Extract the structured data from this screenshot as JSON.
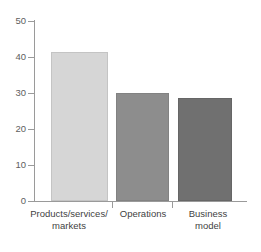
{
  "chart_data": {
    "type": "bar",
    "title": "",
    "subtitle": "",
    "xlabel": "",
    "ylabel": "",
    "categories": [
      "Products/services/ markets",
      "Operations",
      "Business model"
    ],
    "category_lines": [
      [
        "Products/services/",
        "markets"
      ],
      [
        "Operations",
        ""
      ],
      [
        "Business",
        "model"
      ]
    ],
    "values": [
      41.4,
      30.0,
      28.6
    ],
    "ylim": [
      0,
      50
    ],
    "yticks": [
      0,
      10,
      20,
      30,
      40,
      50
    ],
    "ytick_labels": [
      "0",
      "10",
      "20",
      "30",
      "40",
      "50"
    ],
    "grid": false,
    "legend": false,
    "bar_colors": [
      "#d6d6d6",
      "#8d8d8d",
      "#707070"
    ],
    "bar_edge_colors": [
      "#c4c4c4",
      "#828282",
      "#666666"
    ],
    "axis_color": "#9a9a9a",
    "tick_label_color": "#5e5e5e",
    "category_label_color": "#3f3f3f",
    "background": "#ffffff"
  }
}
